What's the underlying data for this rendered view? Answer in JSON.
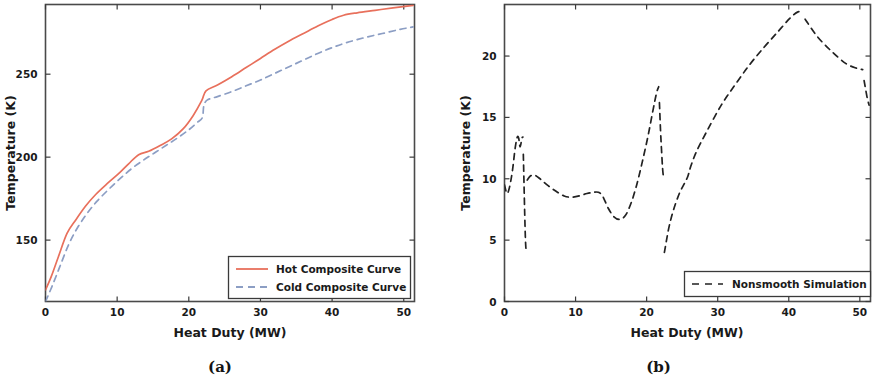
{
  "figure": {
    "panels": [
      {
        "caption": "(a)",
        "xlabel": "Heat Duty (MW)",
        "ylabel": "Temperature (K)",
        "xticks": [
          "0",
          "10",
          "20",
          "30",
          "40",
          "50"
        ],
        "yticks": [
          "150",
          "200",
          "250"
        ],
        "legend": [
          {
            "label": "Hot Composite Curve",
            "style": "solid",
            "color": "#e8705c"
          },
          {
            "label": "Cold Composite Curve",
            "style": "dashed",
            "color": "#8c9ec4"
          }
        ]
      },
      {
        "caption": "(b)",
        "xlabel": "Heat Duty (MW)",
        "ylabel": "Temperature (K)",
        "xticks": [
          "0",
          "10",
          "20",
          "30",
          "40",
          "50"
        ],
        "yticks": [
          "0",
          "5",
          "10",
          "15",
          "20"
        ],
        "legend": [
          {
            "label": "Nonsmooth Simulation",
            "style": "dashed",
            "color": "#222222"
          }
        ]
      }
    ]
  },
  "chart_data": [
    {
      "type": "line",
      "title": "",
      "subfigure": "(a)",
      "xlabel": "Heat Duty (MW)",
      "ylabel": "Temperature (K)",
      "xlim": [
        0,
        51.5
      ],
      "ylim": [
        113,
        292
      ],
      "xticks": [
        0,
        10,
        20,
        30,
        40,
        50
      ],
      "yticks": [
        150,
        200,
        250
      ],
      "grid": false,
      "legend_position": "lower right",
      "series": [
        {
          "name": "Hot Composite Curve",
          "style": "solid",
          "color": "#e8705c",
          "x": [
            0.0,
            0.8,
            1.8,
            3.0,
            4.2,
            5.6,
            7.0,
            8.6,
            10.2,
            11.6,
            13.0,
            14.4,
            16.0,
            17.6,
            19.2,
            20.6,
            21.8,
            22.4,
            24.0,
            26.0,
            28.0,
            30.0,
            32.0,
            34.0,
            36.0,
            38.0,
            40.0,
            41.6,
            43.5,
            46.0,
            48.5,
            51.3
          ],
          "y": [
            120.0,
            128.0,
            140.0,
            154.0,
            162.0,
            170.5,
            177.5,
            184.0,
            190.0,
            196.0,
            201.5,
            203.5,
            207.0,
            211.0,
            217.0,
            225.0,
            234.0,
            240.0,
            243.5,
            248.5,
            254.0,
            259.5,
            265.0,
            270.0,
            274.5,
            279.0,
            283.0,
            285.5,
            287.0,
            288.5,
            290.0,
            291.5
          ]
        },
        {
          "name": "Cold Composite Curve",
          "style": "dashed",
          "color": "#8c9ec4",
          "x": [
            0.0,
            0.9,
            2.0,
            3.2,
            4.4,
            5.8,
            7.2,
            8.8,
            10.4,
            12.0,
            13.6,
            15.2,
            16.8,
            18.4,
            20.0,
            21.2,
            21.9,
            22.1,
            22.6,
            24.0,
            26.0,
            28.0,
            30.0,
            32.0,
            34.0,
            36.0,
            38.0,
            40.0,
            42.0,
            44.5,
            47.0,
            49.5,
            51.3
          ],
          "y": [
            113.0,
            122.0,
            134.0,
            147.0,
            157.0,
            166.0,
            173.5,
            180.5,
            187.0,
            193.0,
            198.0,
            202.5,
            207.0,
            211.5,
            216.5,
            221.0,
            224.0,
            231.0,
            234.5,
            236.5,
            239.5,
            243.0,
            246.5,
            250.5,
            254.5,
            258.5,
            262.5,
            266.0,
            269.0,
            272.0,
            274.5,
            277.0,
            278.5
          ]
        }
      ]
    },
    {
      "type": "line",
      "title": "",
      "subfigure": "(b)",
      "xlabel": "Heat Duty (MW)",
      "ylabel": "Temperature (K)",
      "xlim": [
        0,
        51.5
      ],
      "ylim": [
        0,
        24.2
      ],
      "xticks": [
        0,
        10,
        20,
        30,
        40,
        50
      ],
      "yticks": [
        0,
        5,
        10,
        15,
        20
      ],
      "grid": false,
      "legend_position": "lower right",
      "series": [
        {
          "name": "Nonsmooth Simulation",
          "style": "dashed",
          "color": "#222222",
          "segments": [
            {
              "x": [
                0.0,
                0.35,
                0.7,
                1.1,
                1.5,
                1.8,
                2.0,
                2.2,
                2.45,
                2.6
              ],
              "y": [
                9.5,
                8.8,
                9.3,
                10.6,
                12.5,
                13.4,
                13.3,
                12.6,
                13.3,
                13.4
              ]
            },
            {
              "x": [
                2.65,
                2.75,
                2.85,
                2.95,
                3.05
              ],
              "y": [
                12.0,
                9.5,
                7.0,
                5.0,
                4.0
              ]
            },
            {
              "x": [
                3.2,
                3.6,
                4.2,
                5.0,
                6.0,
                7.2,
                8.4,
                9.4,
                10.5,
                11.6,
                12.5,
                13.2,
                13.8,
                14.6,
                15.4,
                16.2,
                17.0,
                17.8,
                18.6,
                19.4,
                20.2,
                20.9,
                21.4,
                21.7
              ],
              "y": [
                9.9,
                10.2,
                10.3,
                10.0,
                9.5,
                9.0,
                8.6,
                8.5,
                8.6,
                8.8,
                8.9,
                8.9,
                8.6,
                7.6,
                6.9,
                6.7,
                7.0,
                8.0,
                9.5,
                11.4,
                13.5,
                15.6,
                17.0,
                17.5
              ]
            },
            {
              "x": [
                21.8,
                21.95,
                22.1,
                22.25,
                22.4
              ],
              "y": [
                16.2,
                14.0,
                12.3,
                10.8,
                10.0
              ]
            },
            {
              "x": [
                22.5,
                22.8,
                23.2,
                23.8,
                24.6,
                25.3,
                25.8,
                26.2,
                27.0,
                28.5,
                30.5,
                32.5,
                34.5,
                36.5,
                38.5,
                40.2,
                41.3,
                41.9
              ],
              "y": [
                4.0,
                5.0,
                6.2,
                7.5,
                8.8,
                9.6,
                10.2,
                11.0,
                12.2,
                13.9,
                16.0,
                17.7,
                19.3,
                20.7,
                22.0,
                23.1,
                23.6,
                23.5
              ]
            },
            {
              "x": [
                42.3,
                44.0,
                46.0,
                48.0,
                49.6,
                50.4
              ],
              "y": [
                23.0,
                21.6,
                20.4,
                19.4,
                19.0,
                18.9
              ]
            },
            {
              "x": [
                50.6,
                51.0,
                51.3
              ],
              "y": [
                18.0,
                16.7,
                16.0
              ]
            }
          ]
        }
      ]
    }
  ]
}
